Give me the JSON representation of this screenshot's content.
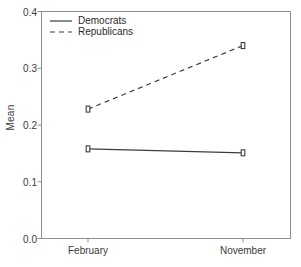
{
  "chart_data": {
    "type": "line",
    "title": "",
    "xlabel": "",
    "ylabel": "Mean",
    "categories": [
      "February",
      "November"
    ],
    "ylim": [
      0.0,
      0.4
    ],
    "yticks": [
      "0.0",
      "0.1",
      "0.2",
      "0.3",
      "0.4"
    ],
    "ytick_values": [
      0.0,
      0.1,
      0.2,
      0.3,
      0.4
    ],
    "grid": false,
    "legend_position": "top-left",
    "series": [
      {
        "name": "Democrats",
        "values": [
          0.158,
          0.151
        ],
        "linestyle": "solid",
        "color": "#3d3d3d",
        "marker": "square"
      },
      {
        "name": "Republicans",
        "values": [
          0.228,
          0.34
        ],
        "linestyle": "dashed",
        "color": "#3d3d3d",
        "marker": "square"
      }
    ]
  },
  "legend": {
    "items": [
      {
        "label": "Democrats",
        "style": "solid"
      },
      {
        "label": "Republicans",
        "style": "dashed"
      }
    ]
  },
  "axes": {
    "y_label": "Mean",
    "x_categories": [
      "February",
      "November"
    ],
    "y_ticks": [
      "0.0",
      "0.1",
      "0.2",
      "0.3",
      "0.4"
    ]
  },
  "colors": {
    "line": "#3d3d3d",
    "frame": "#8e8e8e",
    "text": "#3a3a3a",
    "background": "#ffffff"
  }
}
